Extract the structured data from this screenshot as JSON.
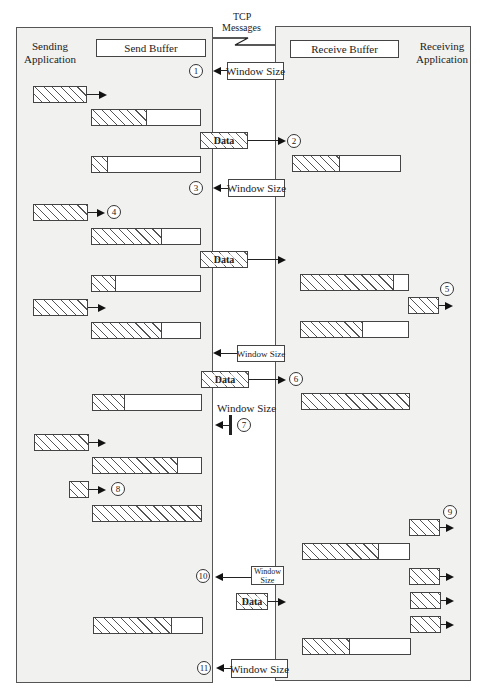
{
  "diagram": {
    "title_link": "TCP Messages",
    "tcp_label_line1": "TCP",
    "tcp_label_line2": "Messages",
    "sender": {
      "label_line1": "Sending",
      "label_line2": "Application",
      "buffer_label": "Send Buffer"
    },
    "receiver": {
      "label_line1": "Receiving",
      "label_line2": "Application",
      "buffer_label": "Receive Buffer"
    },
    "messages": {
      "window_size": "Window Size",
      "window": "Window",
      "size": "Size",
      "data": "Data"
    },
    "steps": [
      "1",
      "2",
      "3",
      "4",
      "5",
      "6",
      "7",
      "8",
      "9",
      "10",
      "11"
    ],
    "colors": {
      "panel_bg": "#f1f1f0",
      "border": "#444444",
      "hatch": "#555555"
    }
  }
}
